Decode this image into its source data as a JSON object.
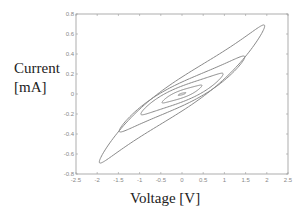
{
  "chart_data": {
    "type": "line",
    "title": "",
    "xlabel": "Voltage [V]",
    "ylabel": "Current [mA]",
    "xlim": [
      -2.5,
      2.5
    ],
    "ylim": [
      -0.8,
      0.8
    ],
    "xticks": [
      -2.5,
      -2,
      -1.5,
      -1,
      -0.5,
      0,
      0.5,
      1,
      1.5,
      2,
      2.5
    ],
    "xtick_labels": [
      "-2.5",
      "-2",
      "-1.5",
      "-1",
      "-0.5",
      "0",
      "0.5",
      "1",
      "1.5",
      "2",
      "2.5"
    ],
    "yticks": [
      0.8,
      0.6,
      0.4,
      0.2,
      0,
      -0.2,
      -0.4,
      -0.6,
      -0.8
    ],
    "ytick_labels": [
      "0.8",
      "0.6",
      "0.4",
      "0.2",
      "0",
      "-0.2",
      "-0.4",
      "-0.6",
      "-0.8"
    ],
    "grid": false,
    "legend": null,
    "line_color": "#8a8a8a",
    "series": [
      {
        "name": "loop 1 (±2 V)",
        "v_amp": 1.95,
        "i_amp": 0.68,
        "i_width_at_zero": 0.17
      },
      {
        "name": "loop 2 (±1.5 V)",
        "v_amp": 1.48,
        "i_amp": 0.37,
        "i_width_at_zero": 0.12
      },
      {
        "name": "loop 3 (±1 V)",
        "v_amp": 0.97,
        "i_amp": 0.2,
        "i_width_at_zero": 0.08
      },
      {
        "name": "loop 4 (±0.5 V)",
        "v_amp": 0.47,
        "i_amp": 0.085,
        "i_width_at_zero": 0.04
      },
      {
        "name": "loop 5 (±0.1 V)",
        "v_amp": 0.09,
        "i_amp": 0.012,
        "i_width_at_zero": 0.008
      }
    ]
  }
}
